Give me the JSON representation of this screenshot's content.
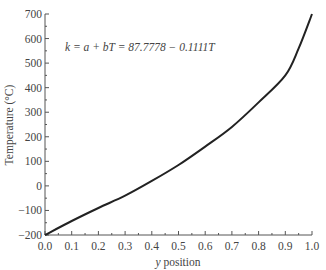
{
  "chart_data": {
    "type": "line",
    "title": "",
    "annotation": "k = a + bT = 87.7778 − 0.1111T",
    "xlabel": "y position",
    "ylabel": "Temperature (°C)",
    "xlim": [
      0.0,
      1.0
    ],
    "ylim": [
      -200,
      700
    ],
    "xticks": [
      "0.0",
      "0.1",
      "0.2",
      "0.3",
      "0.4",
      "0.5",
      "0.6",
      "0.7",
      "0.8",
      "0.9",
      "1.0"
    ],
    "yticks": [
      "-200",
      "-100",
      "0",
      "100",
      "200",
      "300",
      "400",
      "500",
      "600",
      "700"
    ],
    "grid": false,
    "legend": null,
    "series": [
      {
        "name": "Temperature",
        "color": "#222222",
        "x": [
          0.0,
          0.1,
          0.2,
          0.3,
          0.4,
          0.5,
          0.6,
          0.7,
          0.8,
          0.9,
          0.95,
          1.0
        ],
        "y": [
          -200,
          -143,
          -90,
          -40,
          20,
          85,
          160,
          240,
          340,
          450,
          560,
          700
        ]
      }
    ]
  }
}
